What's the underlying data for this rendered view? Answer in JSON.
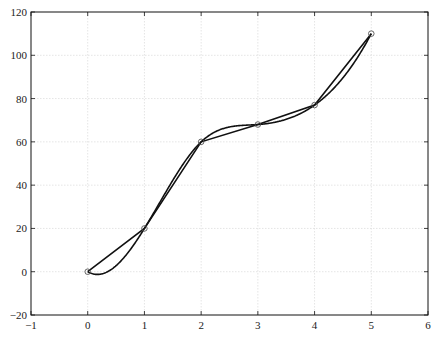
{
  "chart_data": {
    "type": "line",
    "title": "",
    "xlabel": "",
    "ylabel": "",
    "xlim": [
      -1,
      6
    ],
    "ylim": [
      -20,
      120
    ],
    "grid": true,
    "legend": null,
    "x_ticks": [
      -1,
      0,
      1,
      2,
      3,
      4,
      5,
      6
    ],
    "y_ticks": [
      -20,
      0,
      20,
      40,
      60,
      80,
      100,
      120
    ],
    "x": [
      0,
      1,
      2,
      3,
      4,
      5
    ],
    "series": [
      {
        "name": "data points",
        "style": "markers (open circles)",
        "values": [
          0,
          20,
          60,
          68,
          77,
          110
        ]
      },
      {
        "name": "linear interpolation",
        "style": "solid line",
        "values": [
          0,
          20,
          60,
          68,
          77,
          110
        ]
      },
      {
        "name": "smooth interpolation (cubic spline)",
        "style": "solid line",
        "values": [
          0,
          20,
          60,
          68,
          77,
          110
        ],
        "approx_min": {
          "x": 0.2,
          "y": -1.5
        }
      }
    ]
  },
  "colors": {
    "line": "#111111",
    "marker": "#555555",
    "grid": "#d9d9d9",
    "background": "#ffffff"
  }
}
